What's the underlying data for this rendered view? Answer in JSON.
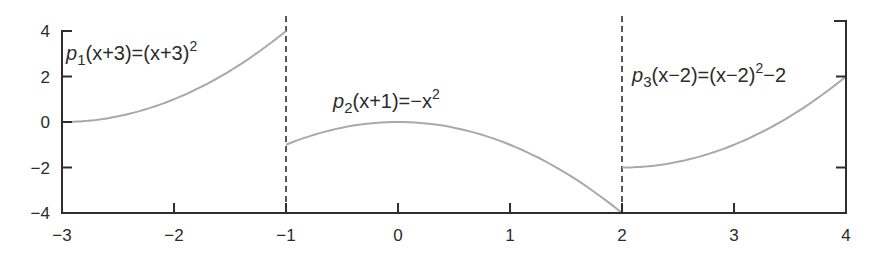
{
  "chart_data": {
    "type": "line",
    "title": "",
    "xlabel": "",
    "ylabel": "",
    "xlim": [
      -3,
      4
    ],
    "ylim": [
      -4,
      4
    ],
    "grid": false,
    "legend": null,
    "x_ticks": [
      -3,
      -2,
      -1,
      0,
      1,
      2,
      3,
      4
    ],
    "x_tick_labels": [
      "−3",
      "−2",
      "−1",
      "0",
      "1",
      "2",
      "3",
      "4"
    ],
    "y_ticks_left": [
      4,
      2,
      0,
      -2,
      -4
    ],
    "y_tick_labels_left": [
      "4",
      "2",
      "0",
      "−2",
      "−4"
    ],
    "y_ticks_right": [
      4,
      2,
      -2,
      -4
    ],
    "breakpoints": [
      -1,
      2
    ],
    "series": [
      {
        "name": "p1",
        "label": "p1(x+3)=(x+3)^2",
        "domain": [
          -3,
          -1
        ],
        "expression": "(x+3)^2",
        "x": [
          -3,
          -2.5,
          -2,
          -1.5,
          -1
        ],
        "y": [
          0,
          0.25,
          1,
          2.25,
          4
        ]
      },
      {
        "name": "p2",
        "label": "p2(x+1)=-x^2",
        "domain": [
          -1,
          2
        ],
        "expression": "-x^2",
        "x": [
          -1,
          -0.5,
          0,
          0.5,
          1,
          1.5,
          2
        ],
        "y": [
          -1,
          -0.25,
          0,
          -0.25,
          -1,
          -2.25,
          -4
        ]
      },
      {
        "name": "p3",
        "label": "p3(x-2)=(x-2)^2-2",
        "domain": [
          2,
          4
        ],
        "expression": "(x-2)^2-2",
        "x": [
          2,
          2.5,
          3,
          3.5,
          4
        ],
        "y": [
          -2,
          -1.75,
          -1,
          0.25,
          2
        ]
      }
    ],
    "annotations": [
      {
        "text": "p1(x+3)=(x+3)^2",
        "x": -2.95,
        "y": 3.3
      },
      {
        "text": "p2(x+1)=-x^2",
        "x": -0.85,
        "y": 1.3
      },
      {
        "text": "p3(x-2)=(x-2)^2-2",
        "x": 2.1,
        "y": 2.2
      }
    ],
    "colors": {
      "curve": "#a9a9a9",
      "axis": "#2e2e2e",
      "dashed": "#2e2e2e"
    }
  },
  "labels": {
    "eq1": {
      "p": "p",
      "sub": "1",
      "lhs_arg": "(x+3)=(x+3)",
      "sup": "2",
      "tail": ""
    },
    "eq2": {
      "p": "p",
      "sub": "2",
      "lhs_arg": "(x+1)=−x",
      "sup": "2",
      "tail": ""
    },
    "eq3": {
      "p": "p",
      "sub": "3",
      "lhs_arg": "(x−2)=(x−2)",
      "sup": "2",
      "tail": "−2"
    }
  }
}
